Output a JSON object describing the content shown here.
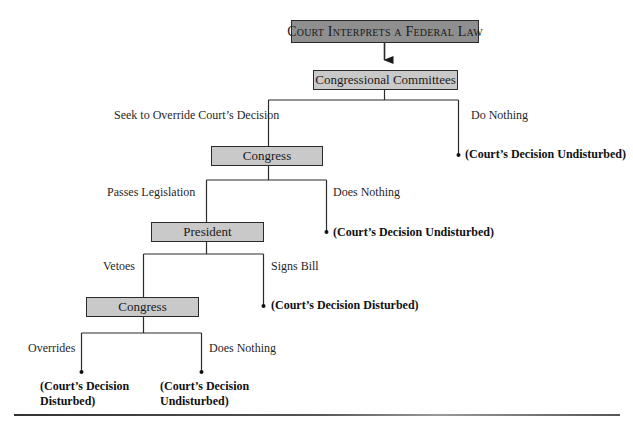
{
  "diagram": {
    "type": "decision-flowchart",
    "colors": {
      "top_box_fill": "#8f8f8f",
      "node_box_fill": "#c9c9c9",
      "line": "#2a2a2a"
    },
    "root": {
      "label": "Court Interprets a Federal Law"
    },
    "nodes": {
      "committees": {
        "label": "Congressional Committees"
      },
      "congress_1": {
        "label": "Congress"
      },
      "president": {
        "label": "President"
      },
      "congress_2": {
        "label": "Congress"
      }
    },
    "edges": {
      "committees_left": {
        "label": "Seek to Override Court’s Decision"
      },
      "committees_right": {
        "label": "Do Nothing"
      },
      "congress_1_left": {
        "label": "Passes Legislation"
      },
      "congress_1_right": {
        "label": "Does Nothing"
      },
      "president_left": {
        "label": "Vetoes"
      },
      "president_right": {
        "label": "Signs Bill"
      },
      "congress_2_left": {
        "label": "Overrides"
      },
      "congress_2_right": {
        "label": "Does Nothing"
      }
    },
    "outcomes": {
      "committees_nothing": {
        "label": "(Court’s Decision Undisturbed)"
      },
      "congress_1_nothing": {
        "label": "(Court’s Decision Undisturbed)"
      },
      "president_signs": {
        "label": "(Court’s Decision Disturbed)"
      },
      "congress_2_overrides": {
        "line1": "(Court’s Decision",
        "line2": "Disturbed)"
      },
      "congress_2_nothing": {
        "line1": "(Court’s Decision",
        "line2": "Undisturbed)"
      }
    }
  }
}
